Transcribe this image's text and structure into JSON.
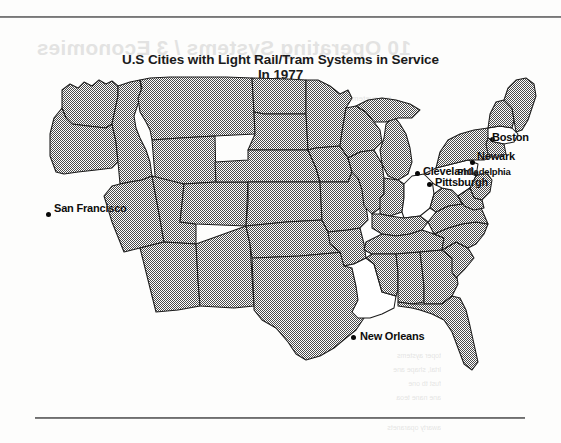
{
  "page": {
    "background_color": "#fdfdfc",
    "rule_color": "#4f4f4f"
  },
  "title": {
    "line1": "U.S Cities with Light Rail/Tram Systems in Service",
    "line2": "In 1977"
  },
  "map": {
    "name": "united-states-map",
    "fill_pattern": "50% black/white dither",
    "fill_color": "#808080",
    "outline_color": "#1c1c1c",
    "unfilled_color": "#ffffff",
    "legend_note": "States containing a listed city are drawn unfilled (white)"
  },
  "cities": [
    {
      "name": "San Francisco",
      "dot_x": 48,
      "dot_y": 214,
      "label_x": 54,
      "label_y": 202,
      "label_size": "normal"
    },
    {
      "name": "New Orleans",
      "dot_x": 353,
      "dot_y": 337,
      "label_x": 360,
      "label_y": 330,
      "label_size": "normal"
    },
    {
      "name": "Cleveland",
      "dot_x": 417,
      "dot_y": 173,
      "label_x": 423,
      "label_y": 165,
      "label_size": "normal"
    },
    {
      "name": "Pittsburgh",
      "dot_x": 429,
      "dot_y": 184,
      "label_x": 435,
      "label_y": 176,
      "label_size": "normal"
    },
    {
      "name": "Philadelphia",
      "dot_x": 475,
      "dot_y": 173,
      "label_x": 457,
      "label_y": 166,
      "label_size": "small"
    },
    {
      "name": "Newark",
      "dot_x": 472,
      "dot_y": 162,
      "label_x": 477,
      "label_y": 150,
      "label_size": "normal"
    },
    {
      "name": "Boston",
      "dot_x": 492,
      "dot_y": 139,
      "label_x": 492,
      "label_y": 131,
      "label_size": "normal"
    }
  ],
  "bleed_through": {
    "heading": "10 Operating Systems / 3 Economies",
    "lines": [
      "ine ayetem an lat",
      "awrtta ny",
      "toper aystems",
      "lrtal, shape ane",
      "fust tb one",
      "ane nane teoa",
      "awarty oparanets"
    ]
  }
}
